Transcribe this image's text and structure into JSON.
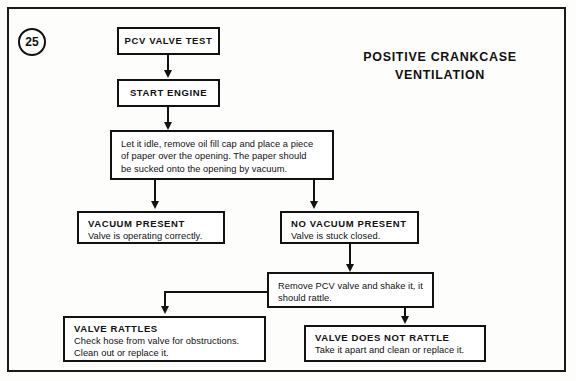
{
  "figure": {
    "number": "25",
    "title_line1": "POSITIVE  CRANKCASE",
    "title_line2": "VENTILATION"
  },
  "flowchart": {
    "nodes": {
      "pcv_valve_test": {
        "heading": "PCV  VALVE  TEST"
      },
      "start_engine": {
        "heading": "START  ENGINE"
      },
      "idle_instruction": {
        "line1": "Let it idle, remove oil fill cap and place a piece",
        "line2": "of paper over the opening. The  paper should",
        "line3": "be sucked onto the opening by vacuum."
      },
      "vacuum_present": {
        "heading": "VACUUM  PRESENT",
        "body": "Valve is operating  correctly."
      },
      "no_vacuum_present": {
        "heading": "NO VACUUM  PRESENT",
        "body": "Valve is stuck closed."
      },
      "remove_pcv_valve": {
        "line1": "Remove PCV valve and shake it, it",
        "line2": "should  rattle."
      },
      "valve_rattles": {
        "heading": "VALVE  RATTLES",
        "body_line1": "Check hose from valve  for obstructions.",
        "body_line2": "Clean out or replace it."
      },
      "valve_does_not_rattle": {
        "heading": "VALVE  DOES  NOT  RATTLE",
        "body": "Take it apart and clean or replace it."
      }
    }
  },
  "colors": {
    "ink": "#121212",
    "paper": "#fdfdfc"
  }
}
